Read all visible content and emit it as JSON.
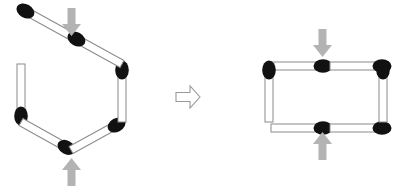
{
  "figure": {
    "caption_faint": "",
    "colors": {
      "background": "#ffffff",
      "match_head": "#111111",
      "match_body_fill": "#ffffff",
      "match_body_stroke": "#8a8a8a",
      "load_arrow": "#b3b3b3",
      "transform_arrow_fill": "#ffffff",
      "transform_arrow_stroke": "#999999"
    },
    "panels": [
      {
        "id": "left-panel",
        "name": "hexagon-figure",
        "shape": "hexagon",
        "match_count": 6,
        "description": "Six matchsticks arranged edge to edge forming a regular hexagon",
        "load_arrows": [
          {
            "name": "top-load-arrow",
            "direction": "down",
            "x": 72,
            "y": 8
          },
          {
            "name": "bottom-load-arrow",
            "direction": "up",
            "x": 72,
            "y": 158
          }
        ],
        "matches": [
          {
            "id": "hex-match-1",
            "x1": 71,
            "y1": 36,
            "x2": 21,
            "y2": 64,
            "head_at": "start"
          },
          {
            "id": "hex-match-2",
            "x1": 21,
            "y1": 64,
            "x2": 21,
            "y2": 122,
            "head_at": "start"
          },
          {
            "id": "hex-match-3",
            "x1": 21,
            "y1": 122,
            "x2": 71,
            "y2": 150,
            "head_at": "start"
          },
          {
            "id": "hex-match-4",
            "x1": 71,
            "y1": 150,
            "x2": 122,
            "y2": 122,
            "head_at": "start"
          },
          {
            "id": "hex-match-5",
            "x1": 122,
            "y1": 122,
            "x2": 122,
            "y2": 64,
            "head_at": "start"
          },
          {
            "id": "hex-match-6",
            "x1": 122,
            "y1": 64,
            "x2": 71,
            "y2": 36,
            "head_at": "start"
          }
        ]
      },
      {
        "id": "right-panel",
        "name": "rectangle-figure",
        "shape": "rectangle",
        "match_count": 6,
        "description": "The same six matchsticks rearranged into a flattened rectangle with gaps at the top and bottom midpoints",
        "load_arrows": [
          {
            "name": "top-load-arrow",
            "direction": "down",
            "x": 323,
            "y": 29
          },
          {
            "name": "bottom-load-arrow",
            "direction": "up",
            "x": 323,
            "y": 132
          }
        ],
        "matches": [
          {
            "id": "rect-match-1",
            "x1": 271,
            "y1": 66,
            "x2": 322,
            "y2": 66,
            "head_at": "end"
          },
          {
            "id": "rect-match-2",
            "x1": 330,
            "y1": 66,
            "x2": 381,
            "y2": 66,
            "head_at": "end"
          },
          {
            "id": "rect-match-3",
            "x1": 271,
            "y1": 128,
            "x2": 322,
            "y2": 128,
            "head_at": "end"
          },
          {
            "id": "rect-match-4",
            "x1": 330,
            "y1": 128,
            "x2": 381,
            "y2": 128,
            "head_at": "end"
          },
          {
            "id": "rect-match-5",
            "x1": 269,
            "y1": 122,
            "x2": 269,
            "y2": 71,
            "head_at": "end"
          },
          {
            "id": "rect-match-6",
            "x1": 383,
            "y1": 122,
            "x2": 383,
            "y2": 71,
            "head_at": "end"
          }
        ]
      }
    ],
    "transform_arrow": {
      "name": "transformation-arrow",
      "direction": "right",
      "x": 176,
      "y": 86,
      "width": 24,
      "height": 22
    }
  }
}
